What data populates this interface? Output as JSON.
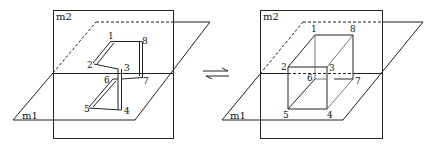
{
  "figure": {
    "left_panel": {
      "plane_vertical_label": "m2",
      "plane_horizontal_label": "m1",
      "vertices": [
        {
          "id": "1",
          "label": "1"
        },
        {
          "id": "2",
          "label": "2"
        },
        {
          "id": "3",
          "label": "3"
        },
        {
          "id": "4",
          "label": "4"
        },
        {
          "id": "5",
          "label": "5"
        },
        {
          "id": "6",
          "label": "6"
        },
        {
          "id": "7",
          "label": "7"
        },
        {
          "id": "8",
          "label": "8"
        }
      ],
      "description": "Folded eight-atom chain crossing planes m1 and m2"
    },
    "equilibrium_arrow": "⇄",
    "right_panel": {
      "plane_vertical_label": "m2",
      "plane_horizontal_label": "m1",
      "vertices": [
        {
          "id": "1",
          "label": "1"
        },
        {
          "id": "2",
          "label": "2"
        },
        {
          "id": "3",
          "label": "3"
        },
        {
          "id": "4",
          "label": "4"
        },
        {
          "id": "5",
          "label": "5"
        },
        {
          "id": "6",
          "label": "6"
        },
        {
          "id": "7",
          "label": "7"
        },
        {
          "id": "8",
          "label": "8"
        }
      ],
      "description": "Cube-shaped eight-vertex structure crossing planes m1 and m2"
    }
  }
}
